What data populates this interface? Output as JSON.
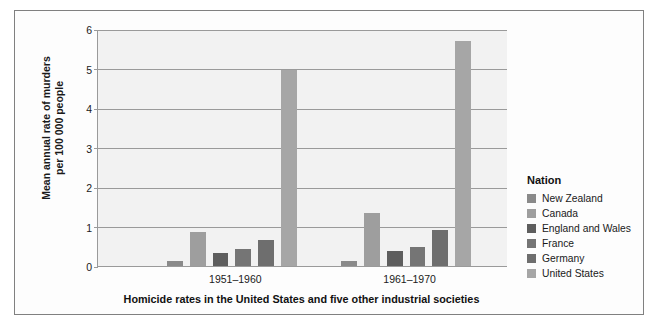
{
  "chart_data": {
    "type": "bar",
    "title": "",
    "caption": "Homicide rates in the United States and five other industrial societies",
    "xlabel": "",
    "ylabel": "Mean annual rate of murders\nper 100 000 people",
    "categories": [
      "1951–1960",
      "1961–1970"
    ],
    "ylim": [
      0,
      6
    ],
    "yticks": [
      0,
      1,
      2,
      3,
      4,
      5,
      6
    ],
    "ytick_labels": [
      "0",
      "1",
      "2",
      "3",
      "4",
      "5",
      "6"
    ],
    "grid": true,
    "legend_position": "right",
    "legend_title": "Nation",
    "series": [
      {
        "name": "New Zealand",
        "color": "#8a8a8a",
        "values": [
          0.12,
          0.13
        ]
      },
      {
        "name": "Canada",
        "color": "#9e9e9e",
        "values": [
          0.85,
          1.35
        ]
      },
      {
        "name": "England and Wales",
        "color": "#5e5e5e",
        "values": [
          0.32,
          0.37
        ]
      },
      {
        "name": "France",
        "color": "#757575",
        "values": [
          0.42,
          0.47
        ]
      },
      {
        "name": "Germany",
        "color": "#6e6e6e",
        "values": [
          0.65,
          0.9
        ]
      },
      {
        "name": "United States",
        "color": "#a6a6a6",
        "values": [
          4.95,
          5.7
        ]
      }
    ]
  },
  "figure": {
    "background": "#fdfdfd",
    "plot_background": "#f2f2f2",
    "border_color": "#808080",
    "gridline_color": "#9a9a9a"
  }
}
